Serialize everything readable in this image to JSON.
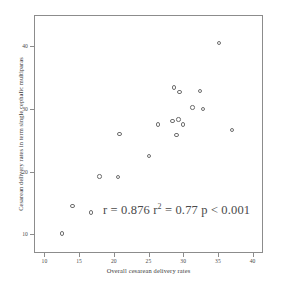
{
  "chart_data": {
    "type": "scatter",
    "title": "",
    "xlabel": "Overall cesarean delivery rates",
    "ylabel": "Cesarean delivery rates in term single cephalic multiparas",
    "xlim": [
      8.5,
      41.5
    ],
    "ylim": [
      7.0,
      45.0
    ],
    "grid": false,
    "legend": null,
    "xticks": [
      10,
      15,
      20,
      25,
      30,
      35,
      40
    ],
    "xticklabels": [
      "10",
      "15",
      "20",
      "25",
      "30",
      "35",
      "40"
    ],
    "yticks": [
      10,
      20,
      30,
      40
    ],
    "yticklabels": [
      "10",
      "20",
      "30",
      "40"
    ],
    "marker": "open-circle",
    "marker_color": "#6e6e6e",
    "points": [
      {
        "x": 12.4,
        "y": 10.3
      },
      {
        "x": 13.9,
        "y": 14.7
      },
      {
        "x": 16.6,
        "y": 13.6
      },
      {
        "x": 17.8,
        "y": 19.4
      },
      {
        "x": 20.5,
        "y": 19.3
      },
      {
        "x": 20.7,
        "y": 26.2
      },
      {
        "x": 24.9,
        "y": 22.6
      },
      {
        "x": 26.2,
        "y": 27.7
      },
      {
        "x": 28.3,
        "y": 28.2
      },
      {
        "x": 28.5,
        "y": 33.6
      },
      {
        "x": 28.9,
        "y": 26.0
      },
      {
        "x": 29.2,
        "y": 28.5
      },
      {
        "x": 29.3,
        "y": 32.9
      },
      {
        "x": 29.8,
        "y": 27.7
      },
      {
        "x": 31.2,
        "y": 30.4
      },
      {
        "x": 32.3,
        "y": 33.0
      },
      {
        "x": 32.7,
        "y": 30.2
      },
      {
        "x": 35.0,
        "y": 40.7
      },
      {
        "x": 36.9,
        "y": 26.8
      }
    ],
    "annotations": [
      {
        "name": "correlation-stats",
        "r_label": "r = 0.876",
        "r2_label_pre": "r",
        "r2_label_sup": "2",
        "r2_label_post": " = 0.77",
        "p_label": "p < 0.001",
        "full_text": "r = 0.876 r2 = 0.77 p < 0.001"
      }
    ]
  },
  "colors": {
    "background": "#ffffff",
    "frame": "#8c8c8c",
    "marker": "#6e6e6e",
    "text": "#3a3a3a"
  }
}
